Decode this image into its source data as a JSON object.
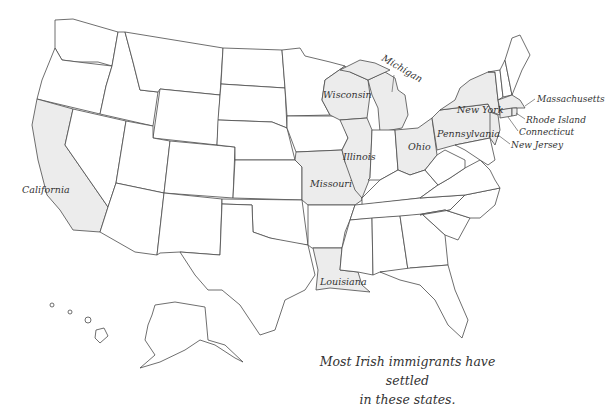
{
  "map": {
    "title": "United States",
    "highlight_color": "#ececec",
    "border_color": "#4a4a4a",
    "highlighted_states": [
      {
        "name": "California",
        "label": "California"
      },
      {
        "name": "Wisconsin",
        "label": "Wisconsin"
      },
      {
        "name": "Michigan",
        "label": "Michigan"
      },
      {
        "name": "Illinois",
        "label": "Illinois"
      },
      {
        "name": "Missouri",
        "label": "Missouri"
      },
      {
        "name": "Ohio",
        "label": "Ohio"
      },
      {
        "name": "Louisiana",
        "label": "Louisiana"
      },
      {
        "name": "New York",
        "label": "New York"
      },
      {
        "name": "Pennsylvania",
        "label": "Pennsylvania"
      },
      {
        "name": "Massachusetts",
        "label": "Massachusetts"
      },
      {
        "name": "Rhode Island",
        "label": "Rhode Island"
      },
      {
        "name": "Connecticut",
        "label": "Connecticut"
      },
      {
        "name": "New Jersey",
        "label": "New Jersey"
      }
    ]
  },
  "caption": {
    "line1": "Most Irish immigrants have settled",
    "line2": "in these states."
  }
}
